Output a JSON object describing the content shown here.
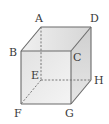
{
  "diagram": {
    "type": "cube",
    "labels": {
      "A": "A",
      "B": "B",
      "C": "C",
      "D": "D",
      "E": "E",
      "F": "F",
      "G": "G",
      "H": "H"
    },
    "hidden_edges": [
      "AE",
      "EF",
      "EH"
    ],
    "colors": {
      "edge": "#6a6a6a",
      "hidden_edge": "#6a6a6a",
      "face_front": "#e9e9e9",
      "face_top": "#dcdcdc",
      "face_side": "#d2d2d2",
      "label": "#3a3a3a"
    }
  }
}
